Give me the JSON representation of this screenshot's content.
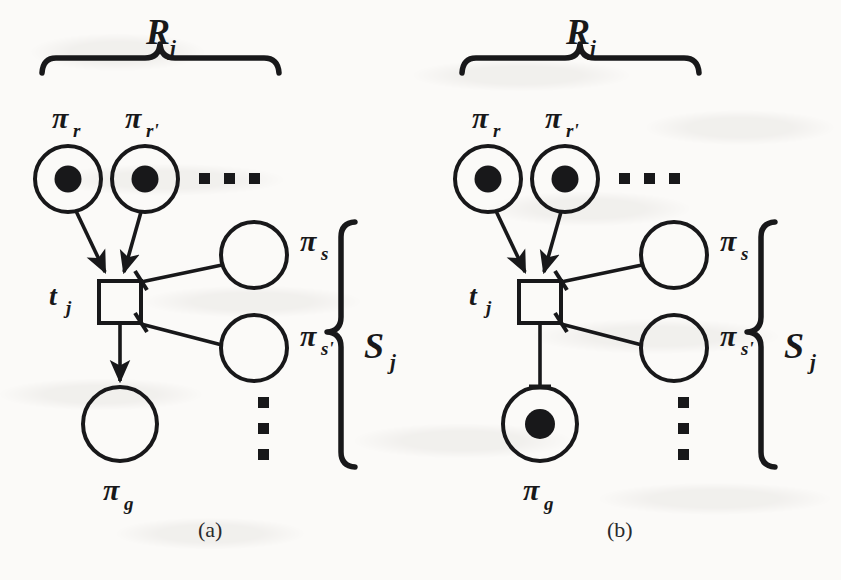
{
  "figure": {
    "kind": "petri-net-diagram",
    "background_color": "#fbfaf8",
    "ink_color": "#18181a",
    "panels": [
      {
        "id": "a",
        "caption": "(a)",
        "origin_x": 0,
        "resource_group": {
          "brace_label": "R",
          "brace_label_sub": "j",
          "places": [
            {
              "label": "π",
              "sub": "r",
              "tokens": 1
            },
            {
              "label": "π",
              "sub": "r'",
              "tokens": 1
            }
          ],
          "ellipsis": "horizontal"
        },
        "transition": {
          "label": "t",
          "sub": "j",
          "filled": false
        },
        "service_group": {
          "brace_label": "S",
          "brace_label_sub": "j",
          "places": [
            {
              "label": "π",
              "sub": "s",
              "tokens": 0
            },
            {
              "label": "π",
              "sub": "s'",
              "tokens": 0
            }
          ],
          "ellipsis": "vertical"
        },
        "goal_place": {
          "label": "π",
          "sub": "g",
          "tokens": 0
        },
        "goal_arc_style": "arrow"
      },
      {
        "id": "b",
        "caption": "(b)",
        "origin_x": 420,
        "resource_group": {
          "brace_label": "R",
          "brace_label_sub": "j",
          "places": [
            {
              "label": "π",
              "sub": "r",
              "tokens": 1
            },
            {
              "label": "π",
              "sub": "r'",
              "tokens": 1
            }
          ],
          "ellipsis": "horizontal"
        },
        "transition": {
          "label": "t",
          "sub": "j",
          "filled": false
        },
        "service_group": {
          "brace_label": "S",
          "brace_label_sub": "j",
          "places": [
            {
              "label": "π",
              "sub": "s",
              "tokens": 0
            },
            {
              "label": "π",
              "sub": "s'",
              "tokens": 0
            }
          ],
          "ellipsis": "vertical"
        },
        "goal_place": {
          "label": "π",
          "sub": "g",
          "tokens": 1
        },
        "goal_arc_style": "bar"
      }
    ]
  }
}
